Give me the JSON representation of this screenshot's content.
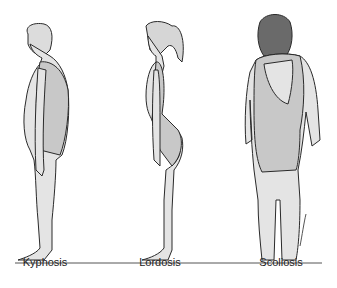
{
  "figure": {
    "figures": [
      {
        "id": "kyphosis",
        "label": "Kyphosis",
        "view": "side"
      },
      {
        "id": "lordosis",
        "label": "Lordosis",
        "view": "side"
      },
      {
        "id": "scoliosis",
        "label": "Scoliosis",
        "view": "back"
      }
    ],
    "colors": {
      "skin": "#e4e4e4",
      "suit": "#c8c8c8",
      "outline": "#2a2a2a",
      "hair_dark": "#6a6a6a",
      "ground": "#555555"
    }
  }
}
